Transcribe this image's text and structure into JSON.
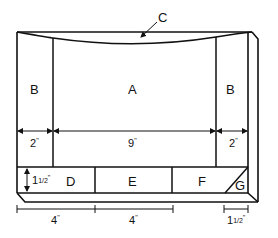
{
  "diagram": {
    "regions": {
      "A": "A",
      "B_left": "B",
      "B_right": "B",
      "C": "C",
      "D": "D",
      "E": "E",
      "F": "F",
      "G": "G"
    },
    "dimensions": {
      "b_left_width": "2",
      "a_width": "9",
      "b_right_width": "2",
      "pocket_height_whole": "1",
      "pocket_height_frac": "1/2",
      "bottom_left_1": "4",
      "bottom_left_2": "4",
      "bottom_right_whole": "1",
      "bottom_right_frac": "1/2",
      "unit_mark": "\""
    },
    "colors": {
      "stroke": "#111111",
      "background": "#ffffff"
    }
  }
}
